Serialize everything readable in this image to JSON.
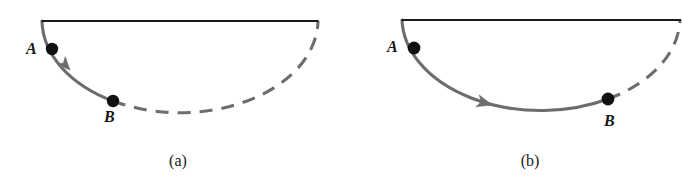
{
  "figure": {
    "background_color": "#ffffff",
    "panels": [
      {
        "id": "panel-a",
        "caption": "(a)",
        "chord": {
          "label": "top-chord",
          "color": "#1a1a1a",
          "x1": 42,
          "y1": 21,
          "x2": 318,
          "y2": 21
        },
        "arc": {
          "label": "bowl-arc",
          "color": "#6d6d6d",
          "solid_color": "#6d6d6d",
          "dashed_color": "#6d6d6d",
          "center_x": 180,
          "center_y": 21,
          "radius_x": 138,
          "radius_y": 93
        },
        "points": [
          {
            "name": "A",
            "label": "A",
            "x": 52,
            "y": 49,
            "radius": 6.2,
            "color": "#111111",
            "label_x": 26,
            "label_y": 40
          },
          {
            "name": "B",
            "label": "B",
            "x": 113,
            "y": 101,
            "radius": 6.2,
            "color": "#111111",
            "label_x": 104,
            "label_y": 108
          }
        ],
        "arrow": {
          "label": "direction-arrow",
          "x": 70,
          "y": 70,
          "color": "#6d6d6d",
          "direction": "down-right"
        }
      },
      {
        "id": "panel-b",
        "caption": "(b)",
        "chord": {
          "label": "top-chord",
          "color": "#1a1a1a",
          "x1": 402,
          "y1": 20,
          "x2": 680,
          "y2": 20
        },
        "arc": {
          "label": "bowl-arc",
          "color": "#6d6d6d",
          "solid_color": "#6d6d6d",
          "dashed_color": "#6d6d6d",
          "center_x": 541,
          "center_y": 20,
          "radius_x": 139,
          "radius_y": 93
        },
        "points": [
          {
            "name": "A",
            "label": "A",
            "x": 414,
            "y": 48,
            "radius": 6.4,
            "color": "#111111",
            "label_x": 387,
            "label_y": 38
          },
          {
            "name": "B",
            "label": "B",
            "x": 608,
            "y": 99,
            "radius": 6.4,
            "color": "#111111",
            "label_x": 604,
            "label_y": 112
          }
        ],
        "arrow": {
          "label": "direction-arrow",
          "x": 486,
          "y": 103,
          "color": "#6d6d6d",
          "direction": "right"
        }
      }
    ]
  }
}
